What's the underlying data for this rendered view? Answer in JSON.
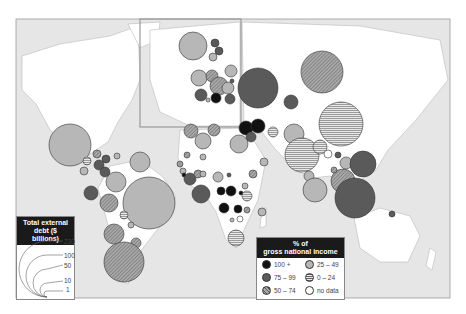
{
  "map": {
    "frame": {
      "x": 16,
      "y": 19,
      "w": 434,
      "h": 279
    },
    "ocean_color": "#e6e6e6",
    "land_color": "#ffffff",
    "inset_europe": {
      "x": 140,
      "y": 19,
      "w": 101,
      "h": 108
    }
  },
  "fills": {
    "100+": "#111111",
    "75-99": "#5a5a5a",
    "50-74": "crosshatch",
    "25-49": "#b7b7b7",
    "0-24": "stripes",
    "no data": "#ffffff"
  },
  "legend_size": {
    "title_line1": "Total external",
    "title_line2": "debt ($ billions)",
    "values": [
      "230",
      "100",
      "50",
      "10",
      "1"
    ]
  },
  "legend_color": {
    "title_line1": "% of",
    "title_line2": "gross national income",
    "items": [
      {
        "label": "100 +",
        "cls": "100+"
      },
      {
        "label": "75 – 99",
        "cls": "75-99"
      },
      {
        "label": "50 – 74",
        "cls": "50-74"
      },
      {
        "label": "25 – 49",
        "cls": "25-49"
      },
      {
        "label": "0 – 24",
        "cls": "0-24"
      },
      {
        "label": "no data",
        "cls": "no data"
      }
    ]
  },
  "circles": [
    {
      "x": 70,
      "y": 145,
      "r": 21,
      "c": "25-49"
    },
    {
      "x": 140,
      "y": 162,
      "r": 10,
      "c": "25-49"
    },
    {
      "x": 97,
      "y": 154,
      "r": 4,
      "c": "50-74"
    },
    {
      "x": 87,
      "y": 161,
      "r": 4,
      "c": "0-24"
    },
    {
      "x": 106,
      "y": 159,
      "r": 4,
      "c": "75-99"
    },
    {
      "x": 99,
      "y": 165,
      "r": 5,
      "c": "75-99"
    },
    {
      "x": 117,
      "y": 156,
      "r": 3,
      "c": "25-49"
    },
    {
      "x": 84,
      "y": 171,
      "r": 4,
      "c": "25-49"
    },
    {
      "x": 105,
      "y": 172,
      "r": 5,
      "c": "75-99"
    },
    {
      "x": 116,
      "y": 182,
      "r": 10,
      "c": "25-49"
    },
    {
      "x": 91,
      "y": 193,
      "r": 7,
      "c": "75-99"
    },
    {
      "x": 109,
      "y": 203,
      "r": 9,
      "c": "50-74"
    },
    {
      "x": 149,
      "y": 203,
      "r": 26,
      "c": "25-49"
    },
    {
      "x": 124,
      "y": 215,
      "r": 4,
      "c": "0-24"
    },
    {
      "x": 131,
      "y": 225,
      "r": 3,
      "c": "25-49"
    },
    {
      "x": 114,
      "y": 234,
      "r": 10,
      "c": "50-74"
    },
    {
      "x": 136,
      "y": 243,
      "r": 5,
      "c": "50-74"
    },
    {
      "x": 124,
      "y": 262,
      "r": 20,
      "c": "50-74"
    },
    {
      "x": 193,
      "y": 46,
      "r": 14,
      "c": "25-49"
    },
    {
      "x": 215,
      "y": 43,
      "r": 4,
      "c": "75-99"
    },
    {
      "x": 219,
      "y": 51,
      "r": 4,
      "c": "75-99"
    },
    {
      "x": 213,
      "y": 57,
      "r": 4,
      "c": "25-49"
    },
    {
      "x": 199,
      "y": 78,
      "r": 8,
      "c": "25-49"
    },
    {
      "x": 212,
      "y": 76,
      "r": 6,
      "c": "50-74"
    },
    {
      "x": 219,
      "y": 86,
      "r": 9,
      "c": "50-74"
    },
    {
      "x": 231,
      "y": 71,
      "r": 6,
      "c": "25-49"
    },
    {
      "x": 228,
      "y": 88,
      "r": 6,
      "c": "25-49"
    },
    {
      "x": 201,
      "y": 95,
      "r": 6,
      "c": "75-99"
    },
    {
      "x": 216,
      "y": 98,
      "r": 5,
      "c": "100+"
    },
    {
      "x": 230,
      "y": 99,
      "r": 5,
      "c": "75-99"
    },
    {
      "x": 232,
      "y": 81,
      "r": 2,
      "c": "75-99"
    },
    {
      "x": 208,
      "y": 100,
      "r": 2,
      "c": "25-49"
    },
    {
      "x": 258,
      "y": 88,
      "r": 20,
      "c": "75-99"
    },
    {
      "x": 322,
      "y": 72,
      "r": 21,
      "c": "50-74"
    },
    {
      "x": 291,
      "y": 102,
      "r": 7,
      "c": "75-99"
    },
    {
      "x": 341,
      "y": 124,
      "r": 22,
      "c": "0-24"
    },
    {
      "x": 246,
      "y": 128,
      "r": 7,
      "c": "100+"
    },
    {
      "x": 258,
      "y": 126,
      "r": 7,
      "c": "100+"
    },
    {
      "x": 251,
      "y": 137,
      "r": 5,
      "c": "75-99"
    },
    {
      "x": 273,
      "y": 132,
      "r": 5,
      "c": "0-24"
    },
    {
      "x": 294,
      "y": 134,
      "r": 10,
      "c": "25-49"
    },
    {
      "x": 302,
      "y": 155,
      "r": 17,
      "c": "0-24"
    },
    {
      "x": 320,
      "y": 147,
      "r": 7,
      "c": "0-24"
    },
    {
      "x": 328,
      "y": 154,
      "r": 4,
      "c": "no data"
    },
    {
      "x": 338,
      "y": 155,
      "r": 3,
      "c": "75-99"
    },
    {
      "x": 346,
      "y": 163,
      "r": 6,
      "c": "25-49"
    },
    {
      "x": 363,
      "y": 164,
      "r": 13,
      "c": "75-99"
    },
    {
      "x": 309,
      "y": 176,
      "r": 5,
      "c": "25-49"
    },
    {
      "x": 315,
      "y": 190,
      "r": 12,
      "c": "25-49"
    },
    {
      "x": 343,
      "y": 181,
      "r": 12,
      "c": "50-74"
    },
    {
      "x": 355,
      "y": 198,
      "r": 20,
      "c": "75-99"
    },
    {
      "x": 334,
      "y": 170,
      "r": 3,
      "c": "50-74"
    },
    {
      "x": 392,
      "y": 214,
      "r": 3,
      "c": "75-99"
    },
    {
      "x": 191,
      "y": 131,
      "r": 7,
      "c": "50-74"
    },
    {
      "x": 214,
      "y": 130,
      "r": 6,
      "c": "50-74"
    },
    {
      "x": 203,
      "y": 141,
      "r": 8,
      "c": "25-49"
    },
    {
      "x": 239,
      "y": 144,
      "r": 9,
      "c": "25-49"
    },
    {
      "x": 187,
      "y": 155,
      "r": 3,
      "c": "50-74"
    },
    {
      "x": 203,
      "y": 157,
      "r": 3,
      "c": "25-49"
    },
    {
      "x": 180,
      "y": 164,
      "r": 3,
      "c": "50-74"
    },
    {
      "x": 183,
      "y": 171,
      "r": 3,
      "c": "25-49"
    },
    {
      "x": 184,
      "y": 175,
      "r": 2,
      "c": "100+"
    },
    {
      "x": 190,
      "y": 179,
      "r": 6,
      "c": "75-99"
    },
    {
      "x": 198,
      "y": 174,
      "r": 4,
      "c": "50-74"
    },
    {
      "x": 203,
      "y": 174,
      "r": 3,
      "c": "25-49"
    },
    {
      "x": 218,
      "y": 177,
      "r": 5,
      "c": "25-49"
    },
    {
      "x": 229,
      "y": 175,
      "r": 2,
      "c": "75-99"
    },
    {
      "x": 201,
      "y": 194,
      "r": 9,
      "c": "75-99"
    },
    {
      "x": 221,
      "y": 191,
      "r": 4,
      "c": "100+"
    },
    {
      "x": 231,
      "y": 191,
      "r": 5,
      "c": "100+"
    },
    {
      "x": 241,
      "y": 193,
      "r": 2,
      "c": "100+"
    },
    {
      "x": 245,
      "y": 186,
      "r": 3,
      "c": "25-49"
    },
    {
      "x": 247,
      "y": 196,
      "r": 5,
      "c": "0-24"
    },
    {
      "x": 253,
      "y": 174,
      "r": 4,
      "c": "50-74"
    },
    {
      "x": 264,
      "y": 162,
      "r": 4,
      "c": "25-49"
    },
    {
      "x": 224,
      "y": 208,
      "r": 5,
      "c": "100+"
    },
    {
      "x": 238,
      "y": 209,
      "r": 4,
      "c": "100+"
    },
    {
      "x": 247,
      "y": 210,
      "r": 3,
      "c": "50-74"
    },
    {
      "x": 240,
      "y": 219,
      "r": 3,
      "c": "no data"
    },
    {
      "x": 232,
      "y": 220,
      "r": 2,
      "c": "25-49"
    },
    {
      "x": 262,
      "y": 212,
      "r": 4,
      "c": "25-49"
    },
    {
      "x": 236,
      "y": 238,
      "r": 8,
      "c": "0-24"
    }
  ]
}
